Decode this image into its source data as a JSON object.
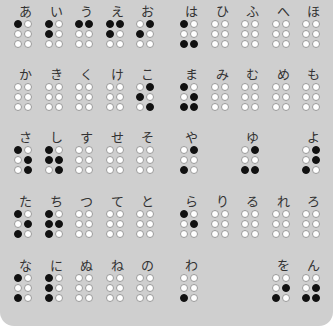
{
  "colors": {
    "background": "#cfcfcf",
    "dot_on": "#111111",
    "dot_off": "#ffffff"
  },
  "rows": [
    {
      "cells": [
        {
          "kana": "あ",
          "dots": [
            1,
            0,
            0,
            0,
            0,
            0
          ]
        },
        {
          "kana": "い",
          "dots": [
            1,
            0,
            1,
            0,
            0,
            0
          ]
        },
        {
          "kana": "う",
          "dots": [
            1,
            1,
            0,
            0,
            0,
            0
          ]
        },
        {
          "kana": "え",
          "dots": [
            1,
            1,
            1,
            0,
            0,
            0
          ]
        },
        {
          "kana": "お",
          "dots": [
            0,
            1,
            1,
            0,
            0,
            0
          ]
        },
        {
          "kana": "は",
          "dots": [
            1,
            0,
            0,
            0,
            1,
            1
          ]
        },
        {
          "kana": "ひ",
          "dots": [
            0,
            0,
            0,
            0,
            0,
            0
          ]
        },
        {
          "kana": "ふ",
          "dots": [
            0,
            0,
            0,
            0,
            0,
            0
          ]
        },
        {
          "kana": "へ",
          "dots": [
            0,
            0,
            0,
            0,
            0,
            0
          ]
        },
        {
          "kana": "ほ",
          "dots": [
            0,
            0,
            0,
            0,
            0,
            0
          ]
        }
      ]
    },
    {
      "cells": [
        {
          "kana": "か",
          "dots": [
            0,
            0,
            0,
            0,
            0,
            0
          ]
        },
        {
          "kana": "き",
          "dots": [
            0,
            0,
            0,
            0,
            0,
            0
          ]
        },
        {
          "kana": "く",
          "dots": [
            0,
            0,
            0,
            0,
            0,
            0
          ]
        },
        {
          "kana": "け",
          "dots": [
            0,
            0,
            0,
            0,
            0,
            0
          ]
        },
        {
          "kana": "こ",
          "dots": [
            0,
            1,
            1,
            0,
            0,
            1
          ]
        },
        {
          "kana": "ま",
          "dots": [
            1,
            0,
            0,
            1,
            1,
            1
          ]
        },
        {
          "kana": "み",
          "dots": [
            0,
            0,
            0,
            0,
            0,
            0
          ]
        },
        {
          "kana": "む",
          "dots": [
            0,
            0,
            0,
            0,
            0,
            0
          ]
        },
        {
          "kana": "め",
          "dots": [
            0,
            0,
            0,
            0,
            0,
            0
          ]
        },
        {
          "kana": "も",
          "dots": [
            0,
            0,
            0,
            0,
            0,
            0
          ]
        }
      ]
    },
    {
      "cells": [
        {
          "kana": "さ",
          "dots": [
            1,
            0,
            0,
            1,
            0,
            1
          ]
        },
        {
          "kana": "し",
          "dots": [
            1,
            0,
            1,
            1,
            0,
            1
          ]
        },
        {
          "kana": "す",
          "dots": [
            0,
            0,
            0,
            0,
            0,
            0
          ]
        },
        {
          "kana": "せ",
          "dots": [
            0,
            0,
            0,
            0,
            0,
            0
          ]
        },
        {
          "kana": "そ",
          "dots": [
            0,
            0,
            0,
            0,
            0,
            0
          ]
        },
        {
          "kana": "や",
          "dots": [
            0,
            1,
            0,
            0,
            1,
            0
          ]
        },
        null,
        {
          "kana": "ゆ",
          "dots": [
            0,
            1,
            0,
            0,
            1,
            1
          ]
        },
        null,
        {
          "kana": "よ",
          "dots": [
            0,
            1,
            0,
            1,
            1,
            0
          ]
        }
      ]
    },
    {
      "cells": [
        {
          "kana": "た",
          "dots": [
            1,
            0,
            0,
            1,
            1,
            0
          ]
        },
        {
          "kana": "ち",
          "dots": [
            1,
            0,
            1,
            1,
            1,
            0
          ]
        },
        {
          "kana": "つ",
          "dots": [
            0,
            0,
            0,
            0,
            0,
            0
          ]
        },
        {
          "kana": "て",
          "dots": [
            0,
            0,
            0,
            0,
            0,
            0
          ]
        },
        {
          "kana": "と",
          "dots": [
            0,
            0,
            0,
            0,
            0,
            0
          ]
        },
        {
          "kana": "ら",
          "dots": [
            1,
            0,
            0,
            1,
            0,
            0
          ]
        },
        {
          "kana": "り",
          "dots": [
            0,
            0,
            0,
            0,
            0,
            0
          ]
        },
        {
          "kana": "る",
          "dots": [
            0,
            0,
            0,
            0,
            0,
            0
          ]
        },
        {
          "kana": "れ",
          "dots": [
            0,
            0,
            0,
            0,
            0,
            0
          ]
        },
        {
          "kana": "ろ",
          "dots": [
            0,
            0,
            0,
            0,
            0,
            0
          ]
        }
      ]
    },
    {
      "cells": [
        {
          "kana": "な",
          "dots": [
            1,
            0,
            0,
            0,
            1,
            0
          ]
        },
        {
          "kana": "に",
          "dots": [
            1,
            0,
            1,
            0,
            1,
            0
          ]
        },
        {
          "kana": "ぬ",
          "dots": [
            0,
            0,
            0,
            0,
            0,
            0
          ]
        },
        {
          "kana": "ね",
          "dots": [
            0,
            0,
            0,
            0,
            0,
            0
          ]
        },
        {
          "kana": "の",
          "dots": [
            0,
            0,
            0,
            0,
            0,
            0
          ]
        },
        {
          "kana": "わ",
          "dots": [
            0,
            0,
            0,
            0,
            1,
            0
          ]
        },
        null,
        null,
        {
          "kana": "を",
          "dots": [
            0,
            0,
            0,
            1,
            1,
            0
          ]
        },
        {
          "kana": "ん",
          "dots": [
            0,
            0,
            0,
            1,
            1,
            1
          ]
        }
      ]
    }
  ]
}
